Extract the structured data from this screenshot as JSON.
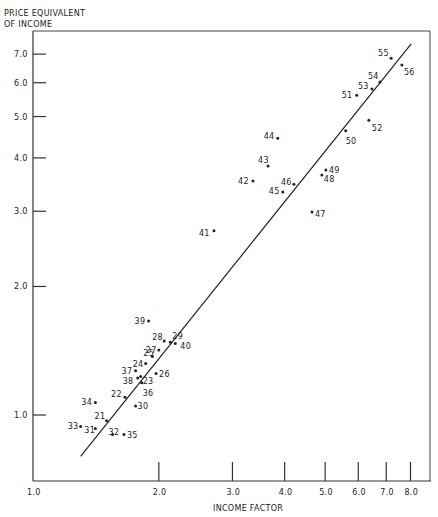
{
  "chart_data": {
    "type": "scatter",
    "title": "",
    "ylabel": "PRICE EQUIVALENT OF INCOME",
    "ylabel_lines": [
      "PRICE EQUIVALENT",
      "OF INCOME"
    ],
    "xlabel": "INCOME FACTOR",
    "xscale": "log",
    "yscale": "log",
    "xlim": [
      1.0,
      8.6
    ],
    "ylim": [
      0.73,
      7.9
    ],
    "xticks": [
      1.0,
      2.0,
      3.0,
      4.0,
      5.0,
      6.0,
      7.0,
      8.0
    ],
    "xtick_labels": [
      "1.0",
      "2.0",
      "3.0",
      "4.0",
      "5.0",
      "6.0",
      "7.0",
      "8.0"
    ],
    "yticks": [
      1.0,
      2.0,
      3.0,
      4.0,
      5.0,
      6.0,
      7.0
    ],
    "ytick_labels": [
      "1.0",
      "2.0",
      "3.0",
      "4.0",
      "5.0",
      "6.0",
      "7.0"
    ],
    "grid": false,
    "legend": "none",
    "points": [
      {
        "label": "21",
        "x": 1.5,
        "y": 0.97
      },
      {
        "label": "22",
        "x": 1.66,
        "y": 1.1
      },
      {
        "label": "23",
        "x": 1.81,
        "y": 1.23
      },
      {
        "label": "24",
        "x": 1.86,
        "y": 1.32
      },
      {
        "label": "25",
        "x": 1.93,
        "y": 1.37
      },
      {
        "label": "26",
        "x": 1.97,
        "y": 1.25
      },
      {
        "label": "27",
        "x": 2.0,
        "y": 1.42
      },
      {
        "label": "28",
        "x": 2.06,
        "y": 1.49
      },
      {
        "label": "29",
        "x": 2.13,
        "y": 1.48
      },
      {
        "label": "30",
        "x": 1.76,
        "y": 1.05
      },
      {
        "label": "31",
        "x": 1.41,
        "y": 0.93
      },
      {
        "label": "32",
        "x": 1.55,
        "y": 0.9
      },
      {
        "label": "33",
        "x": 1.3,
        "y": 0.94
      },
      {
        "label": "34",
        "x": 1.41,
        "y": 1.07
      },
      {
        "label": "35",
        "x": 1.65,
        "y": 0.9
      },
      {
        "label": "36",
        "x": 1.82,
        "y": 1.19
      },
      {
        "label": "37",
        "x": 1.76,
        "y": 1.27
      },
      {
        "label": "38",
        "x": 1.78,
        "y": 1.22
      },
      {
        "label": "39",
        "x": 1.89,
        "y": 1.66
      },
      {
        "label": "40",
        "x": 2.19,
        "y": 1.47
      },
      {
        "label": "41",
        "x": 2.71,
        "y": 2.7
      },
      {
        "label": "42",
        "x": 3.36,
        "y": 3.53
      },
      {
        "label": "43",
        "x": 3.65,
        "y": 3.83
      },
      {
        "label": "44",
        "x": 3.85,
        "y": 4.45
      },
      {
        "label": "45",
        "x": 3.96,
        "y": 3.33
      },
      {
        "label": "46",
        "x": 4.21,
        "y": 3.47
      },
      {
        "label": "47",
        "x": 4.65,
        "y": 2.99
      },
      {
        "label": "48",
        "x": 4.91,
        "y": 3.65
      },
      {
        "label": "49",
        "x": 5.02,
        "y": 3.75
      },
      {
        "label": "50",
        "x": 5.6,
        "y": 4.63
      },
      {
        "label": "51",
        "x": 5.95,
        "y": 5.61
      },
      {
        "label": "52",
        "x": 6.36,
        "y": 4.9
      },
      {
        "label": "53",
        "x": 6.47,
        "y": 5.8
      },
      {
        "label": "54",
        "x": 6.76,
        "y": 6.02
      },
      {
        "label": "55",
        "x": 7.19,
        "y": 6.85
      },
      {
        "label": "56",
        "x": 7.63,
        "y": 6.6
      }
    ],
    "fit_line": {
      "x": [
        1.3,
        8.03
      ],
      "y": [
        0.8,
        7.4
      ]
    }
  }
}
